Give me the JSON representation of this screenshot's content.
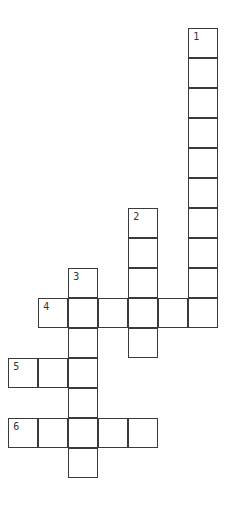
{
  "puzzle": {
    "cell_size": 30,
    "origin": {
      "x": 9,
      "y": 29
    },
    "line_color": "#3a3a3a",
    "words": [
      {
        "number": "1",
        "direction": "down",
        "row": 0,
        "col": 6,
        "length": 10
      },
      {
        "number": "2",
        "direction": "down",
        "row": 6,
        "col": 4,
        "length": 5
      },
      {
        "number": "3",
        "direction": "down",
        "row": 8,
        "col": 2,
        "length": 7
      },
      {
        "number": "4",
        "direction": "across",
        "row": 9,
        "col": 1,
        "length": 6
      },
      {
        "number": "5",
        "direction": "across",
        "row": 11,
        "col": 0,
        "length": 3
      },
      {
        "number": "6",
        "direction": "across",
        "row": 13,
        "col": 0,
        "length": 5
      }
    ]
  }
}
